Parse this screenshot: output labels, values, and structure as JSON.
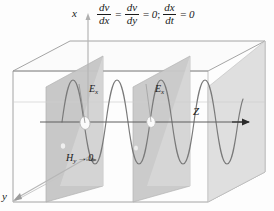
{
  "figure": {
    "title_equation": {
      "terms": [
        {
          "kind": "fraction",
          "numerator": "dv",
          "denominator": "dx"
        },
        {
          "kind": "operator",
          "text": "="
        },
        {
          "kind": "fraction",
          "numerator": "dv",
          "denominator": "dy"
        },
        {
          "kind": "operator",
          "text": "="
        },
        {
          "kind": "value",
          "text": "0"
        },
        {
          "kind": "separator",
          "text": ";"
        },
        {
          "kind": "fraction",
          "numerator": "dx",
          "denominator": "dt"
        },
        {
          "kind": "operator",
          "text": "="
        },
        {
          "kind": "value",
          "text": "0"
        }
      ],
      "plain": "dv/dx = dv/dy = 0; dx/dt = 0"
    },
    "axes": {
      "x_label": "x",
      "y_label": "y",
      "z_label": "Z"
    },
    "field_labels": {
      "e_first_base": "E",
      "e_first_sub": "x",
      "e_second_base": "E",
      "e_second_sub": "x",
      "h_base": "H",
      "h_sub": "y",
      "h_arrow": "→",
      "h_value": "0"
    },
    "colors": {
      "line": "#6e6e6e",
      "dark_line": "#3a3a3a",
      "plane_dark": "#c3c3c3",
      "plane_mid": "#cfcfcf",
      "plane_light": "#dcdcdc",
      "box_face": "#f2f2f2",
      "text": "#1a1a1a",
      "background": "#fdfdfd",
      "wave": "#707070",
      "marker_fill": "#fbfbfb"
    },
    "wave": {
      "type": "sine",
      "cycles": 4,
      "amplitude_px": 46,
      "baseline_y_px": 122,
      "start_x_px": 62,
      "end_x_px": 243
    },
    "planes": [
      {
        "name": "plane-1",
        "shade": "dark"
      },
      {
        "name": "plane-2",
        "shade": "mid"
      },
      {
        "name": "plane-3",
        "shade": "light"
      }
    ],
    "markers": [
      {
        "name": "node-marker-1"
      },
      {
        "name": "node-marker-2"
      }
    ]
  }
}
